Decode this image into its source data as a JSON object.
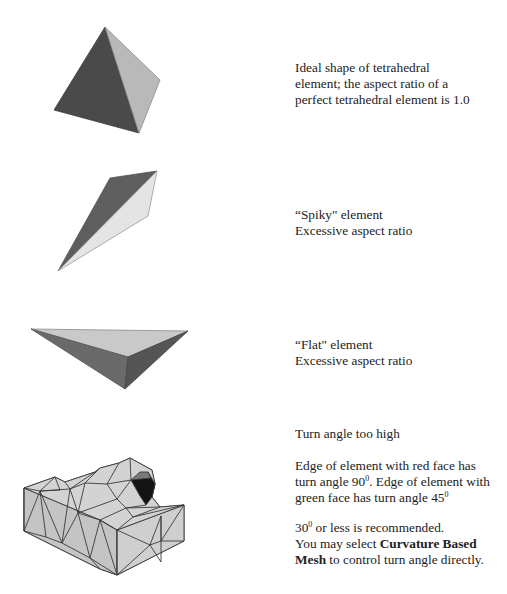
{
  "sections": [
    {
      "id": "ideal",
      "figure": "tetrahedron-ideal",
      "lines": [
        "Ideal shape of tetrahedral",
        "element; the aspect ratio of a",
        "perfect tetrahedral element is 1.0"
      ]
    },
    {
      "id": "spiky",
      "figure": "tetrahedron-spiky",
      "lines": [
        "“Spiky\" element",
        "Excessive aspect ratio"
      ]
    },
    {
      "id": "flat",
      "figure": "tetrahedron-flat",
      "lines": [
        "“Flat\" element",
        "Excessive aspect ratio"
      ]
    },
    {
      "id": "turn-angle",
      "figure": "mesh-block",
      "heading": "Turn angle too high",
      "para1": {
        "l1": "Edge of element with red face has",
        "l2a": "turn angle 90",
        "l2sup": "0",
        "l2b": ". Edge of element with",
        "l3a": "green face has turn angle 45",
        "l3sup": "0"
      },
      "para2": {
        "l1a": "30",
        "l1sup": "0",
        "l1b": " or less is recommended.",
        "l2a": "You may select ",
        "l2bold": "Curvature Based",
        "l3bold": "Mesh",
        "l3b": " to control turn angle directly."
      }
    }
  ],
  "colors": {
    "dark_face": "#4a4a4a",
    "mid_face": "#6e6e6e",
    "light_face": "#bdbdbd",
    "pale_face": "#e2e2e2",
    "mesh_face": "#c8c8c8",
    "mesh_edge": "#3a3a3a",
    "highlight_dark": "#141414",
    "highlight_mid": "#7a7a7a"
  }
}
